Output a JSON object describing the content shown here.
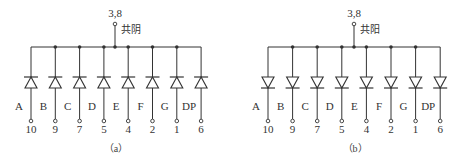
{
  "diagrams": [
    {
      "id": "a",
      "caption": "（a）",
      "type": "common-cathode",
      "common_label": "共阴",
      "common_pin": "3,8",
      "segments": [
        {
          "label": "A",
          "pin": "10"
        },
        {
          "label": "B",
          "pin": "9"
        },
        {
          "label": "C",
          "pin": "7"
        },
        {
          "label": "D",
          "pin": "5"
        },
        {
          "label": "E",
          "pin": "4"
        },
        {
          "label": "F",
          "pin": "2"
        },
        {
          "label": "G",
          "pin": "1"
        },
        {
          "label": "DP",
          "pin": "6"
        }
      ]
    },
    {
      "id": "b",
      "caption": "（b）",
      "type": "common-anode",
      "common_label": "共阳",
      "common_pin": "3,8",
      "segments": [
        {
          "label": "A",
          "pin": "10"
        },
        {
          "label": "B",
          "pin": "9"
        },
        {
          "label": "C",
          "pin": "7"
        },
        {
          "label": "D",
          "pin": "5"
        },
        {
          "label": "E",
          "pin": "4"
        },
        {
          "label": "F",
          "pin": "2"
        },
        {
          "label": "G",
          "pin": "1"
        },
        {
          "label": "DP",
          "pin": "6"
        }
      ]
    }
  ],
  "colors": {
    "line": "#333333",
    "background": "#ffffff"
  }
}
